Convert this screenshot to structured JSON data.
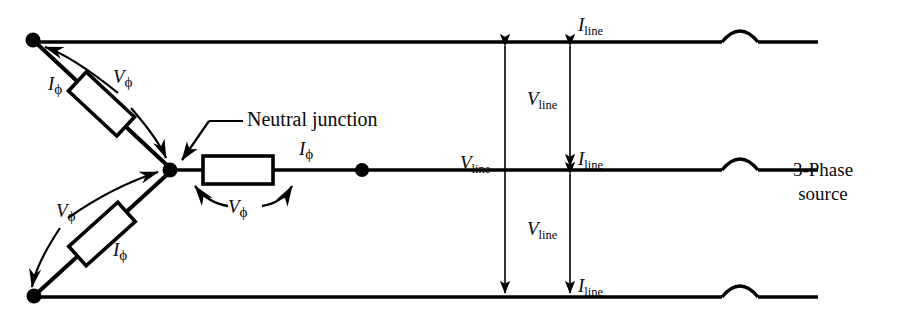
{
  "figure": {
    "type": "circuit-schematic",
    "width": 910,
    "height": 324,
    "line_color": "#000000",
    "background_color": "#ffffff"
  },
  "labels": {
    "neutral_junction": "Neutral junction",
    "source": {
      "line1": "3-Phase",
      "line2": "source"
    },
    "i_phase": "I",
    "v_phase": "V",
    "phi_sub": "ϕ",
    "i_line": "I",
    "v_line": "V",
    "line_sub": "line"
  },
  "phase_branches": [
    {
      "name": "branch-upper",
      "node": "top-left-terminal",
      "current_label": "I",
      "current_sub": "ϕ",
      "voltage_label": "V",
      "voltage_sub": "ϕ"
    },
    {
      "name": "branch-middle",
      "node": "middle-line-terminal",
      "current_label": "I",
      "current_sub": "ϕ",
      "voltage_label": "V",
      "voltage_sub": "ϕ"
    },
    {
      "name": "branch-lower",
      "node": "bottom-left-terminal",
      "current_label": "I",
      "current_sub": "ϕ",
      "voltage_label": "V",
      "voltage_sub": "ϕ"
    }
  ],
  "lines": [
    {
      "name": "line-a",
      "y": 42,
      "current_label": "I",
      "current_sub": "line"
    },
    {
      "name": "line-b",
      "y": 170,
      "current_label": "I",
      "current_sub": "line"
    },
    {
      "name": "line-c",
      "y": 297,
      "current_label": "I",
      "current_sub": "line"
    }
  ],
  "measurements": [
    {
      "name": "v-line-outer",
      "label": "V",
      "sub": "line",
      "between": [
        "line-a",
        "line-c"
      ]
    },
    {
      "name": "v-line-ab",
      "label": "V",
      "sub": "line",
      "between": [
        "line-a",
        "line-b"
      ]
    },
    {
      "name": "v-line-bc",
      "label": "V",
      "sub": "line",
      "between": [
        "line-b",
        "line-c"
      ]
    }
  ]
}
